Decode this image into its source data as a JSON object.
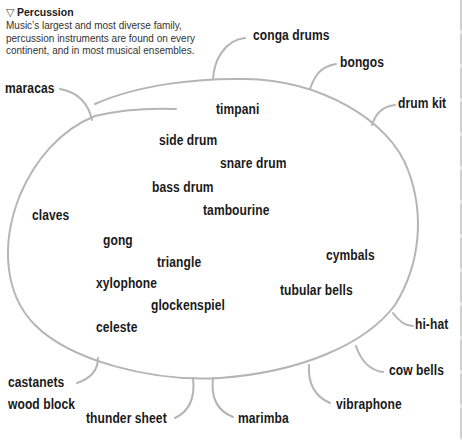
{
  "header": {
    "icon": "triangle-down-icon",
    "title": "Percussion",
    "description_lines": [
      "Music’s largest and most diverse family,",
      "percussion instruments are found on every",
      "continent, and in most musical ensembles."
    ]
  },
  "colors": {
    "outline": "#b5b5b5",
    "text": "#1a1a1a"
  },
  "inside": {
    "timpani": "timpani",
    "side_drum": "side drum",
    "snare_drum": "snare drum",
    "bass_drum": "bass drum",
    "tambourine": "tambourine",
    "claves": "claves",
    "gong": "gong",
    "triangle": "triangle",
    "cymbals": "cymbals",
    "xylophone": "xylophone",
    "tubular_bells": "tubular bells",
    "glockenspiel": "glockenspiel",
    "celeste": "celeste"
  },
  "outside": {
    "conga_drums": "conga drums",
    "bongos": "bongos",
    "maracas": "maracas",
    "drum_kit": "drum kit",
    "hi_hat": "hi-hat",
    "cow_bells": "cow bells",
    "castanets": "castanets",
    "wood_block": "wood block",
    "thunder_sheet": "thunder sheet",
    "marimba": "marimba",
    "vibraphone": "vibraphone"
  }
}
